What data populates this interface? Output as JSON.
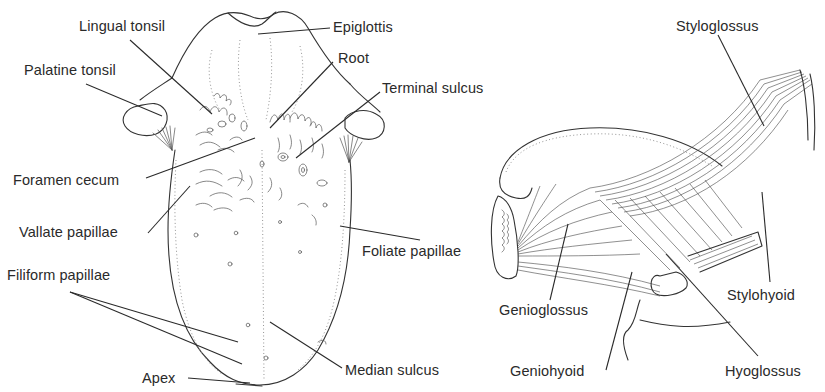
{
  "figure": {
    "left_panel": {
      "name": "Dorsal surface of tongue",
      "labels": {
        "lingual_tonsil": "Lingual tonsil",
        "epiglottis": "Epiglottis",
        "palatine_tonsil": "Palatine tonsil",
        "root": "Root",
        "terminal_sulcus": "Terminal sulcus",
        "foramen_cecum": "Foramen cecum",
        "vallate_papillae": "Vallate papillae",
        "foliate_papillae": "Foliate papillae",
        "filiform_papillae": "Filiform papillae",
        "apex": "Apex",
        "median_sulcus": "Median sulcus"
      }
    },
    "right_panel": {
      "name": "Lateral view of extrinsic tongue muscles",
      "labels": {
        "styloglossus": "Styloglossus",
        "genioglossus": "Genioglossus",
        "stylohyoid": "Stylohyoid",
        "geniohyoid": "Geniohyoid",
        "hyoglossus": "Hyoglossus"
      }
    },
    "colors": {
      "background": "#ffffff",
      "ink": "#2a2a2a"
    }
  }
}
